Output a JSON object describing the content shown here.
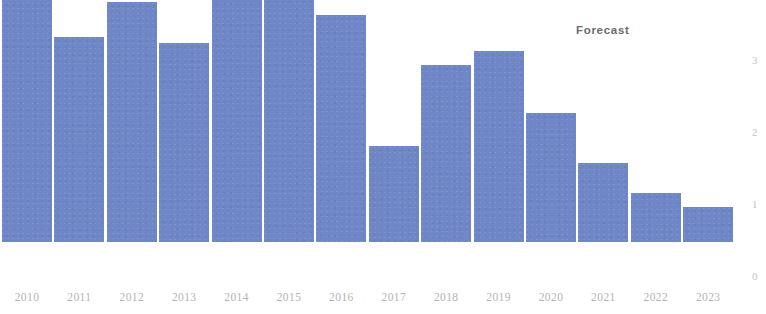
{
  "chart_data": {
    "type": "bar",
    "title": "",
    "subtitle": "",
    "xlabel": "",
    "ylabel": "",
    "categories": [
      "2010",
      "2011",
      "2012",
      "2013",
      "2014",
      "2015",
      "2016",
      "2017",
      "2018",
      "2019",
      "2020",
      "2021",
      "2022",
      "2023"
    ],
    "values": [
      3.54,
      2.85,
      3.33,
      2.76,
      3.75,
      3.68,
      3.15,
      1.33,
      2.46,
      2.65,
      1.79,
      1.1,
      0.68,
      0.49
    ],
    "series": [
      {
        "name": "",
        "values": [
          3.54,
          2.85,
          3.33,
          2.76,
          3.75,
          3.68,
          3.15,
          1.33,
          2.46,
          2.65,
          1.79,
          1.1,
          0.68,
          0.49
        ]
      }
    ],
    "ylim": [
      0,
      3.88
    ],
    "yticks": [
      0,
      1,
      2,
      3
    ],
    "ytick_labels": [
      "0",
      "1",
      "2",
      "3"
    ],
    "y_axis_position": "right",
    "grid": false,
    "legend": "none",
    "bar_color": "#6f87c6",
    "annotations": [
      {
        "text": "Forecast",
        "x": 2021.2,
        "y": 3.5,
        "name": "forecast-annotation"
      }
    ]
  },
  "axis": {
    "x_labels": [
      "2010",
      "2011",
      "2012",
      "2013",
      "2014",
      "2015",
      "2016",
      "2017",
      "2018",
      "2019",
      "2020",
      "2021",
      "2022",
      "2023"
    ],
    "y_labels": [
      "3",
      "2",
      "1",
      "0"
    ]
  },
  "annotation": {
    "forecast_label": "Forecast"
  },
  "colors": {
    "bar": "#6f87c6",
    "xtick_text": "#b3b3b3",
    "ytick_text": "#c4c4c4",
    "annotation_text": "#6b6b6b",
    "background": "#ffffff"
  }
}
